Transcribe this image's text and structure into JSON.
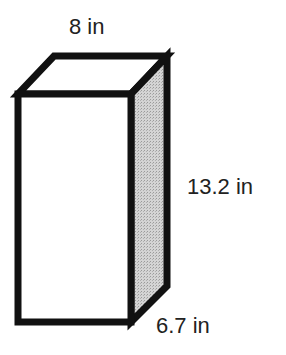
{
  "figure": {
    "type": "rectangular-prism",
    "colors": {
      "stroke": "#111111",
      "front_face": "#ffffff",
      "top_face": "#ffffff",
      "side_face": "#c8c8c8"
    }
  },
  "labels": {
    "width": "8 in",
    "height": "13.2 in",
    "depth": "6.7 in"
  }
}
